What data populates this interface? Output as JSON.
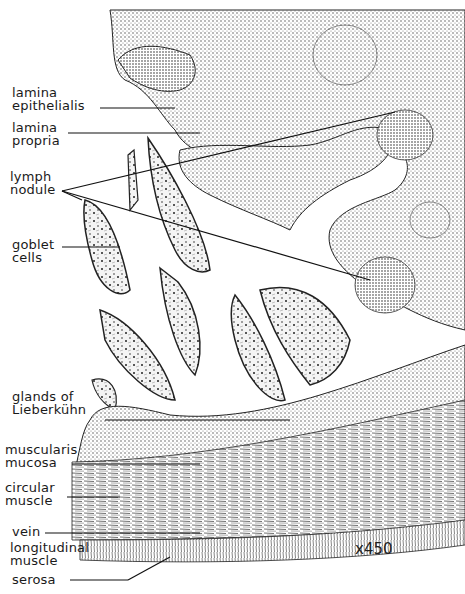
{
  "figure": {
    "type": "histology illustration",
    "magnification": "x450"
  },
  "labels": [
    {
      "id": "lamina-epithelialis",
      "line1": "lamina",
      "line2": "epithelialis"
    },
    {
      "id": "lamina-propria",
      "line1": "lamina",
      "line2": "propria"
    },
    {
      "id": "lymph-nodule",
      "line1": "lymph",
      "line2": "nodule"
    },
    {
      "id": "goblet-cells",
      "line1": "goblet",
      "line2": "cells"
    },
    {
      "id": "glands-of-lieberkuhn",
      "line1": "glands of",
      "line2": "Lieberkühn"
    },
    {
      "id": "muscularis-mucosa",
      "line1": "muscularis",
      "line2": "mucosa"
    },
    {
      "id": "circular-muscle",
      "line1": "circular",
      "line2": "muscle"
    },
    {
      "id": "vein",
      "line1": "vein",
      "line2": ""
    },
    {
      "id": "longitudinal-muscle",
      "line1": "longitudinal",
      "line2": "muscle"
    },
    {
      "id": "serosa",
      "line1": "serosa",
      "line2": ""
    }
  ],
  "colors": {
    "ink": "#1a1a1a",
    "stipple": "#555555",
    "background": "#ffffff"
  }
}
